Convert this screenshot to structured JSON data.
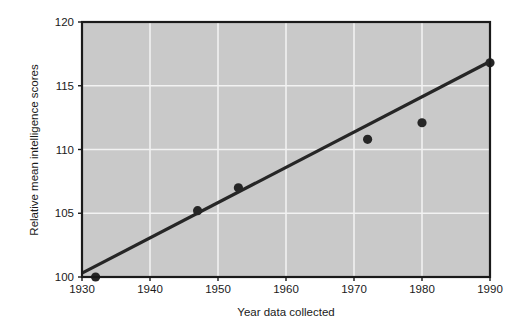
{
  "chart_data": {
    "type": "scatter",
    "title": "",
    "xlabel": "Year data collected",
    "ylabel": "Relative mean intelligence scores",
    "xlim": [
      1930,
      1990
    ],
    "ylim": [
      100,
      120
    ],
    "xticks": [
      1930,
      1940,
      1950,
      1960,
      1970,
      1980,
      1990
    ],
    "xtick_labels": [
      "1930",
      "1940",
      "1950",
      "1960",
      "1970",
      "1980",
      "1990"
    ],
    "yticks": [
      100,
      105,
      110,
      115,
      120
    ],
    "ytick_labels": [
      "100",
      "105",
      "110",
      "115",
      "120"
    ],
    "grid": true,
    "grid_color": "#f2f2f2",
    "plot_background": "#c9c9c9",
    "figure_background": "#ffffff",
    "legend": null,
    "series": [
      {
        "name": "Observed scores",
        "type": "scatter",
        "marker": "circle",
        "color": "#262626",
        "points": [
          {
            "x": 1932,
            "y": 100.0
          },
          {
            "x": 1947,
            "y": 105.2
          },
          {
            "x": 1953,
            "y": 107.0
          },
          {
            "x": 1972,
            "y": 110.8
          },
          {
            "x": 1980,
            "y": 112.1
          },
          {
            "x": 1990,
            "y": 116.8
          }
        ]
      },
      {
        "name": "Trend line",
        "type": "line",
        "color": "#262626",
        "points": [
          {
            "x": 1930,
            "y": 100.3
          },
          {
            "x": 1990,
            "y": 116.9
          }
        ]
      }
    ]
  },
  "layout": {
    "plot_left": 82,
    "plot_top": 22,
    "plot_right": 490,
    "plot_bottom": 277
  }
}
